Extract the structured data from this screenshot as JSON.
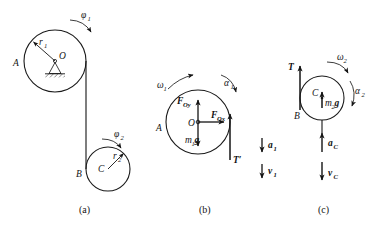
{
  "figure": {
    "background_color": "#ffffff",
    "ink_color": "#141414",
    "panels": [
      {
        "id": "a",
        "caption": "(a)",
        "description": "Pulley A on fixed pivot O with cord to body B with center C",
        "labels": {
          "phi1": "φ",
          "phi1_sub": "1",
          "phi2": "φ",
          "phi2_sub": "2",
          "r1": "r",
          "r1_sub": "1",
          "r2": "r",
          "r2_sub": "2",
          "O": "O",
          "A": "A",
          "B": "B",
          "C": "C"
        }
      },
      {
        "id": "b",
        "caption": "(b)",
        "description": "Free-body diagram of pulley A",
        "labels": {
          "omega1": "ω",
          "omega1_sub": "1",
          "alpha1": "α",
          "alpha1_sub": "1",
          "F_Oy": "F",
          "F_Oy_sub": "Oy",
          "F_Ox": "F",
          "F_Ox_sub": "Ox",
          "m1g": "m",
          "m1g_sub": "1",
          "m1g_tail": "g",
          "O": "O",
          "A": "A",
          "T_prime": "T′",
          "a1": "a",
          "a1_sub": "1",
          "v1": "v",
          "v1_sub": "1"
        }
      },
      {
        "id": "c",
        "caption": "(c)",
        "description": "Free-body diagram of hanging body B",
        "labels": {
          "omega2": "ω",
          "omega2_sub": "2",
          "alpha2": "α",
          "alpha2_sub": "2",
          "T": "T",
          "m2g": "m",
          "m2g_sub": "2",
          "m2g_tail": "g",
          "C": "C",
          "B": "B",
          "aC": "a",
          "aC_sub": "C",
          "vC": "v",
          "vC_sub": "C"
        }
      }
    ]
  }
}
